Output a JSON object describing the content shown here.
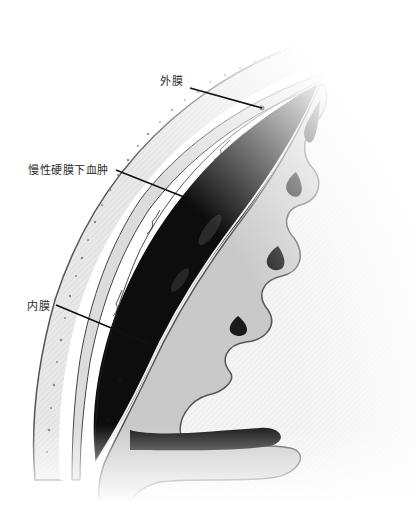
{
  "figure": {
    "labels": [
      {
        "id": "outer-membrane",
        "text": "外膜",
        "x": 160,
        "y": 72,
        "line": [
          190,
          88,
          262,
          108
        ]
      },
      {
        "id": "chronic-subdural-hematoma",
        "text": "慢性硬膜下血肿",
        "x": 28,
        "y": 161,
        "line": [
          116,
          170,
          194,
          201
        ]
      },
      {
        "id": "inner-membrane",
        "text": "内膜",
        "x": 27,
        "y": 297,
        "line": [
          56,
          305,
          145,
          342
        ]
      }
    ],
    "colors": {
      "background": "#ffffff",
      "skull": "#e6e6e6",
      "skull_outline": "#555555",
      "dura_gap": "#ffffff",
      "hematoma": "#0d0d0d",
      "cortex_gray": "#c9c9c9",
      "white_matter": "#f2f2f2",
      "sulcus_dark": "#1a1a1a",
      "leader_line": "#111111"
    }
  }
}
